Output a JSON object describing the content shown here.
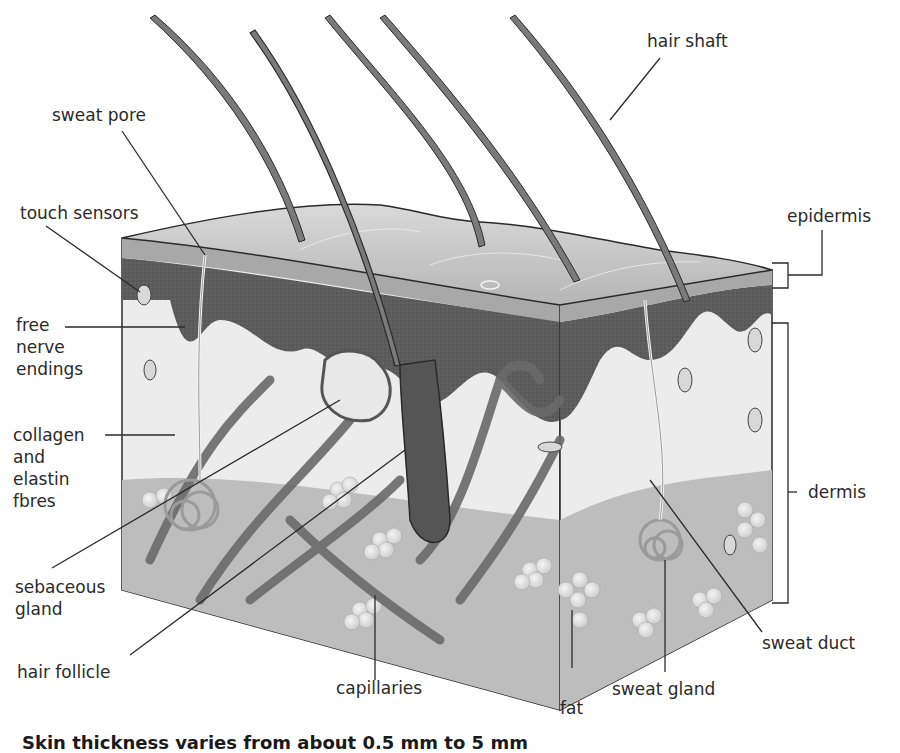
{
  "labels": {
    "sweat_pore": "sweat pore",
    "touch_sensors": "touch sensors",
    "free_nerve_endings": "free\nnerve\nendings",
    "collagen": "collagen\nand\nelastin\nfbres",
    "sebaceous_gland": "sebaceous\ngland",
    "hair_follicle": "hair follicle",
    "capillaries": "capillaries",
    "fat": "fat",
    "sweat_gland": "sweat gland",
    "sweat_duct": "sweat duct",
    "dermis": "dermis",
    "epidermis": "epidermis",
    "hair_shaft": "hair shaft"
  },
  "caption": "Skin thickness varies from about 0.5 mm to 5 mm",
  "colors": {
    "surface": "#c8c8c8",
    "epidermis_dark": "#5a5a5a",
    "dermis": "#ececec",
    "fat_layer": "#bdbdbd",
    "hair": "#7a7a7a",
    "vessel": "#6a6a6a",
    "line": "#2a2a2a"
  }
}
